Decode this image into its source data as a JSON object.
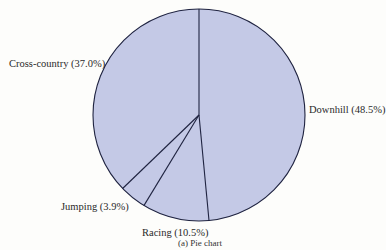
{
  "chart_data": {
    "type": "pie",
    "title": "",
    "caption": "(a) Pie chart",
    "center": [
      199,
      115
    ],
    "radius": 106,
    "fill_color": "#c4c9e6",
    "stroke_color": "#1f2340",
    "labels_sum_percent": 99.9,
    "note": "Labeled percentages sum to 99.9%, not 100% (likely rounding in the source). Slice boundaries are drawn at the angles measured from the image; they agree with the labels to within ~0.3 percentage points.",
    "slices": [
      {
        "label": "Downhill",
        "value": 48.5,
        "display": "Downhill (48.5%)",
        "start_deg": 0,
        "end_deg": 174.6
      },
      {
        "label": "Racing",
        "value": 10.5,
        "display": "Racing (10.5%)",
        "start_deg": 174.6,
        "end_deg": 211.3
      },
      {
        "label": "Jumping",
        "value": 3.9,
        "display": "Jumping (3.9%)",
        "start_deg": 211.3,
        "end_deg": 226.1
      },
      {
        "label": "Cross-country",
        "value": 37.0,
        "display": "Cross-country (37.0%)",
        "start_deg": 226.1,
        "end_deg": 360
      }
    ],
    "label_positions": [
      {
        "left": 309,
        "top": 104
      },
      {
        "left": 142,
        "top": 227
      },
      {
        "left": 61,
        "top": 201
      },
      {
        "left": 9,
        "top": 58
      }
    ]
  }
}
